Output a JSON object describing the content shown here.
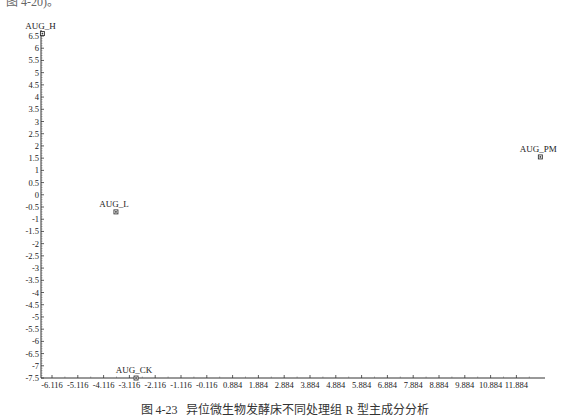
{
  "header_fragment": "图 4-20)。",
  "caption": "图 4-23   异位微生物发酵床不同处理组 R 型主成分分析",
  "chart_data": {
    "type": "scatter",
    "title": "图 4-23 异位微生物发酵床不同处理组 R 型主成分分析",
    "xlabel": "",
    "ylabel": "",
    "xlim": [
      -6.116,
      12.9
    ],
    "ylim": [
      -7.5,
      6.7
    ],
    "grid": false,
    "legend": "none",
    "x_ticks": [
      "-6.116",
      "-5.116",
      "-4.116",
      "-3.116",
      "-2.116",
      "-1.116",
      "-0.116",
      "0.884",
      "1.884",
      "2.884",
      "3.884",
      "4.884",
      "5.884",
      "6.884",
      "7.884",
      "8.884",
      "9.884",
      "10.884",
      "11.884"
    ],
    "y_ticks": [
      "6.5",
      "6",
      "5.5",
      "5",
      "4.5",
      "4",
      "3.5",
      "3",
      "2.5",
      "2",
      "1.5",
      "1",
      "0.5",
      "0",
      "-0.5",
      "-1",
      "-1.5",
      "-2",
      "-2.5",
      "-3",
      "-3.5",
      "-4",
      "-4.5",
      "-5",
      "-5.5",
      "-6",
      "-6.5",
      "-7",
      "-7.5"
    ],
    "points": [
      {
        "label": "AUG_H",
        "x": -6.1,
        "y": 6.6
      },
      {
        "label": "AUG_L",
        "x": -3.25,
        "y": -0.7
      },
      {
        "label": "AUG_CK",
        "x": -2.47,
        "y": -7.5
      },
      {
        "label": "AUG_PM",
        "x": 13.2,
        "y": 1.55
      }
    ]
  }
}
